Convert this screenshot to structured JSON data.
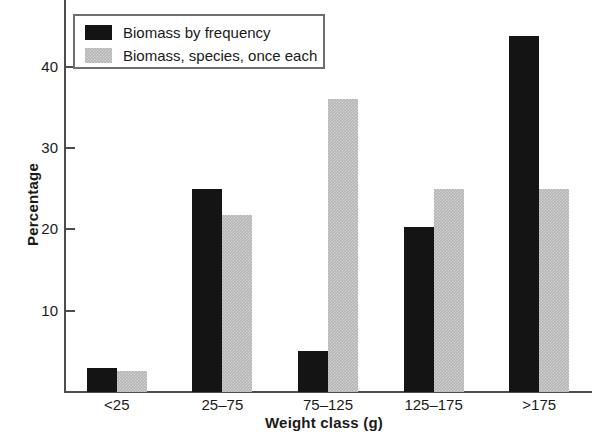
{
  "chart_data": {
    "type": "bar",
    "title": "",
    "xlabel": "Weight class (g)",
    "ylabel": "Percentage",
    "categories": [
      "<25",
      "25–75",
      "75–125",
      "125–175",
      ">175"
    ],
    "series": [
      {
        "name": "Biomass by frequency",
        "color": "#141414",
        "values": [
          3.0,
          25.0,
          5.0,
          20.3,
          43.8
        ]
      },
      {
        "name": "Biomass, species, once each",
        "color": "#b6b6b6",
        "values": [
          2.6,
          21.8,
          36.0,
          25.0,
          25.0
        ]
      }
    ],
    "ylim": [
      0,
      50
    ],
    "yticks": [
      10,
      20,
      30,
      40,
      50
    ],
    "ytick_labels": [
      "10",
      "20",
      "30",
      "40",
      "50"
    ],
    "grid": false,
    "legend_position": "top-left",
    "note_top_tick_clipped": "50"
  },
  "legend": {
    "entries": [
      {
        "label": "Biomass by frequency",
        "swatch": "dark-swatch"
      },
      {
        "label": "Biomass, species, once each",
        "swatch": "light-swatch"
      }
    ]
  },
  "axes": {
    "y_title": "Percentage",
    "x_title": "Weight class (g)"
  }
}
